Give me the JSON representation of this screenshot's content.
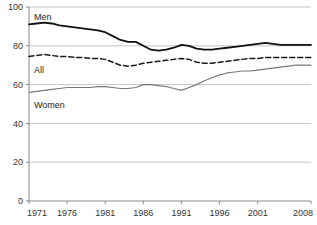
{
  "chart_data": {
    "type": "line",
    "title": "",
    "subtitle": "",
    "xlabel": "",
    "ylabel": "",
    "xlim": [
      1971,
      2008
    ],
    "ylim": [
      0,
      100
    ],
    "grid": true,
    "legend_position": "inline-labels",
    "x_tick_labels": [
      "1971",
      "1976",
      "1981",
      "1986",
      "1991",
      "1996",
      "2001",
      "2008"
    ],
    "x_ticks": [
      1971,
      1976,
      1981,
      1986,
      1991,
      1996,
      2001,
      2008
    ],
    "y_tick_labels": [
      "0",
      "20",
      "40",
      "60",
      "80",
      "100"
    ],
    "y_ticks": [
      0,
      20,
      40,
      60,
      80,
      100
    ],
    "x": [
      1971,
      1972,
      1973,
      1974,
      1975,
      1976,
      1977,
      1978,
      1979,
      1980,
      1981,
      1982,
      1983,
      1984,
      1985,
      1986,
      1987,
      1988,
      1989,
      1990,
      1991,
      1992,
      1993,
      1994,
      1995,
      1996,
      1997,
      1998,
      1999,
      2000,
      2001,
      2002,
      2003,
      2004,
      2005,
      2006,
      2007,
      2008
    ],
    "series": [
      {
        "name": "Men",
        "label": "Men",
        "style": "solid",
        "color": "#111111",
        "width": 1.8,
        "values": [
          91,
          91.5,
          92,
          91.5,
          90.5,
          90,
          89.5,
          89,
          88.5,
          88,
          87,
          85,
          83,
          82,
          82,
          80,
          78,
          77.5,
          78,
          79,
          80.5,
          80,
          78.5,
          78,
          78,
          78.5,
          79,
          79.5,
          80,
          80.5,
          81,
          81.5,
          81,
          80.5,
          80.5,
          80.5,
          80.5,
          80.5
        ]
      },
      {
        "name": "All",
        "label": "All",
        "style": "dashed",
        "color": "#1a1a1a",
        "width": 1.5,
        "values": [
          74.5,
          75,
          75.5,
          75,
          74.5,
          74.5,
          74,
          74,
          73.5,
          73.5,
          73,
          71.5,
          70,
          69.5,
          70,
          71,
          71.5,
          72,
          72.5,
          73,
          73.5,
          73,
          71.5,
          71,
          71,
          71.5,
          72,
          72.5,
          73,
          73.5,
          73.5,
          74,
          74,
          74,
          74,
          74,
          74,
          74
        ]
      },
      {
        "name": "Women",
        "label": "Women",
        "style": "solid",
        "color": "#7a7a7a",
        "width": 1.2,
        "values": [
          56,
          56.5,
          57,
          57.5,
          58,
          58.5,
          58.5,
          58.5,
          58.5,
          59,
          59,
          58.5,
          58,
          58,
          58.5,
          60,
          60,
          59.5,
          59,
          58,
          57,
          58.5,
          60,
          62,
          63.5,
          65,
          66,
          66.5,
          67,
          67,
          67.5,
          68,
          68.5,
          69,
          69.5,
          70,
          70,
          70
        ]
      }
    ],
    "axis_color": "#8a8a8a",
    "grid_color": "#b5b5b5"
  }
}
